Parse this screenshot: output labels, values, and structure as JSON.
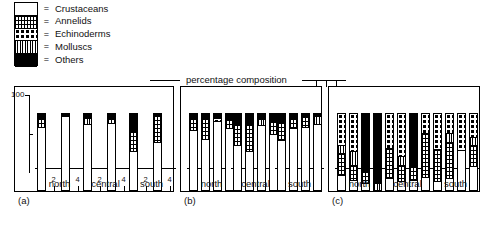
{
  "figure": {
    "header": "percentage  composition",
    "y_axis_label": "100"
  },
  "legend": {
    "items": [
      {
        "label": "Crustaceans",
        "pattern": "p-crust",
        "icon": "white-swatch",
        "equals": "="
      },
      {
        "label": "Annelids",
        "pattern": "p-annel",
        "icon": "fine-grid-swatch",
        "equals": "="
      },
      {
        "label": "Echinoderms",
        "pattern": "p-echin",
        "icon": "dotted-swatch",
        "equals": "="
      },
      {
        "label": "Molluscs",
        "pattern": "p-moll",
        "icon": "vertical-hatch-swatch",
        "equals": "="
      },
      {
        "label": "Others",
        "pattern": "p-other",
        "icon": "black-swatch",
        "equals": "="
      }
    ]
  },
  "panels": [
    {
      "id": "a",
      "label": "(a)"
    },
    {
      "id": "b",
      "label": "(b)"
    },
    {
      "id": "c",
      "label": "(c)"
    }
  ],
  "groups": [
    "north",
    "central",
    "south"
  ],
  "stations": [
    "1",
    "2",
    "3",
    "4"
  ],
  "chart_data": {
    "type": "bar",
    "subtype": "stacked-bar-percentage",
    "title": "percentage  composition",
    "xlabel": "",
    "ylabel": "100",
    "ylim": [
      0,
      100
    ],
    "grid": false,
    "legend_position": "top-left",
    "categories": [
      "Crustaceans",
      "Annelids",
      "Echinoderms",
      "Molluscs",
      "Others"
    ],
    "panels": [
      {
        "panel": "(a)",
        "groups": [
          {
            "name": "north",
            "bars": [
              {
                "station": "1",
                "total": 100,
                "segments": [
                  {
                    "category": "Crustaceans",
                    "value": 82
                  },
                  {
                    "category": "Annelids",
                    "value": 12
                  },
                  {
                    "category": "Others",
                    "value": 6
                  }
                ]
              },
              {
                "station": "2",
                "total": 0,
                "segments": []
              },
              {
                "station": "3",
                "total": 100,
                "segments": [
                  {
                    "category": "Crustaceans",
                    "value": 96
                  },
                  {
                    "category": "Others",
                    "value": 4
                  }
                ]
              },
              {
                "station": "4",
                "total": 0,
                "segments": []
              }
            ]
          },
          {
            "name": "central",
            "bars": [
              {
                "station": "1",
                "total": 100,
                "segments": [
                  {
                    "category": "Crustaceans",
                    "value": 86
                  },
                  {
                    "category": "Molluscs",
                    "value": 7
                  },
                  {
                    "category": "Others",
                    "value": 7
                  }
                ]
              },
              {
                "station": "2",
                "total": 0,
                "segments": []
              },
              {
                "station": "3",
                "total": 100,
                "segments": [
                  {
                    "category": "Crustaceans",
                    "value": 87
                  },
                  {
                    "category": "Annelids",
                    "value": 6
                  },
                  {
                    "category": "Others",
                    "value": 7
                  }
                ]
              },
              {
                "station": "4",
                "total": 0,
                "segments": []
              }
            ]
          },
          {
            "name": "south",
            "bars": [
              {
                "station": "1",
                "total": 100,
                "segments": [
                  {
                    "category": "Crustaceans",
                    "value": 50
                  },
                  {
                    "category": "Annelids",
                    "value": 26
                  },
                  {
                    "category": "Others",
                    "value": 24
                  }
                ]
              },
              {
                "station": "2",
                "total": 0,
                "segments": []
              },
              {
                "station": "3",
                "total": 100,
                "segments": [
                  {
                    "category": "Crustaceans",
                    "value": 62
                  },
                  {
                    "category": "Annelids",
                    "value": 36
                  },
                  {
                    "category": "Others",
                    "value": 2
                  }
                ]
              },
              {
                "station": "4",
                "total": 0,
                "segments": []
              }
            ]
          }
        ]
      },
      {
        "panel": "(b)",
        "groups": [
          {
            "name": "north",
            "bars": [
              {
                "station": "1",
                "total": 100,
                "segments": [
                  {
                    "category": "Crustaceans",
                    "value": 78
                  },
                  {
                    "category": "Annelids",
                    "value": 16
                  },
                  {
                    "category": "Others",
                    "value": 6
                  }
                ]
              },
              {
                "station": "2",
                "total": 100,
                "segments": [
                  {
                    "category": "Crustaceans",
                    "value": 66
                  },
                  {
                    "category": "Annelids",
                    "value": 27
                  },
                  {
                    "category": "Others",
                    "value": 7
                  }
                ]
              },
              {
                "station": "3",
                "total": 100,
                "segments": [
                  {
                    "category": "Crustaceans",
                    "value": 90
                  },
                  {
                    "category": "Echinoderms",
                    "value": 4
                  },
                  {
                    "category": "Others",
                    "value": 6
                  }
                ]
              },
              {
                "station": "4",
                "total": 100,
                "segments": [
                  {
                    "category": "Crustaceans",
                    "value": 80
                  },
                  {
                    "category": "Annelids",
                    "value": 12
                  },
                  {
                    "category": "Others",
                    "value": 8
                  }
                ]
              }
            ]
          },
          {
            "name": "central",
            "bars": [
              {
                "station": "1",
                "total": 100,
                "segments": [
                  {
                    "category": "Crustaceans",
                    "value": 58
                  },
                  {
                    "category": "Annelids",
                    "value": 28
                  },
                  {
                    "category": "Others",
                    "value": 14
                  }
                ]
              },
              {
                "station": "2",
                "total": 100,
                "segments": [
                  {
                    "category": "Crustaceans",
                    "value": 50
                  },
                  {
                    "category": "Annelids",
                    "value": 36
                  },
                  {
                    "category": "Others",
                    "value": 14
                  }
                ]
              },
              {
                "station": "3",
                "total": 100,
                "segments": [
                  {
                    "category": "Crustaceans",
                    "value": 84
                  },
                  {
                    "category": "Molluscs",
                    "value": 8
                  },
                  {
                    "category": "Others",
                    "value": 8
                  }
                ]
              },
              {
                "station": "4",
                "total": 100,
                "segments": [
                  {
                    "category": "Crustaceans",
                    "value": 72
                  },
                  {
                    "category": "Annelids",
                    "value": 18
                  },
                  {
                    "category": "Others",
                    "value": 10
                  }
                ]
              }
            ]
          },
          {
            "name": "south",
            "bars": [
              {
                "station": "1",
                "total": 100,
                "segments": [
                  {
                    "category": "Crustaceans",
                    "value": 64
                  },
                  {
                    "category": "Annelids",
                    "value": 24
                  },
                  {
                    "category": "Others",
                    "value": 12
                  }
                ]
              },
              {
                "station": "2",
                "total": 100,
                "segments": [
                  {
                    "category": "Crustaceans",
                    "value": 80
                  },
                  {
                    "category": "Annelids",
                    "value": 14
                  },
                  {
                    "category": "Others",
                    "value": 6
                  }
                ]
              },
              {
                "station": "3",
                "total": 100,
                "segments": [
                  {
                    "category": "Crustaceans",
                    "value": 82
                  },
                  {
                    "category": "Annelids",
                    "value": 14
                  },
                  {
                    "category": "Others",
                    "value": 4
                  }
                ]
              },
              {
                "station": "4",
                "total": 100,
                "segments": [
                  {
                    "category": "Crustaceans",
                    "value": 86
                  },
                  {
                    "category": "Molluscs",
                    "value": 10
                  },
                  {
                    "category": "Others",
                    "value": 4
                  }
                ]
              }
            ]
          }
        ]
      },
      {
        "panel": "(c)",
        "groups": [
          {
            "name": "north",
            "bars": [
              {
                "station": "1",
                "total": 100,
                "segments": [
                  {
                    "category": "Crustaceans",
                    "value": 18
                  },
                  {
                    "category": "Annelids",
                    "value": 30
                  },
                  {
                    "category": "Molluscs",
                    "value": 10
                  },
                  {
                    "category": "Echinoderms",
                    "value": 42
                  }
                ]
              },
              {
                "station": "2",
                "total": 100,
                "segments": [
                  {
                    "category": "Crustaceans",
                    "value": 12
                  },
                  {
                    "category": "Annelids",
                    "value": 20
                  },
                  {
                    "category": "Molluscs",
                    "value": 18
                  },
                  {
                    "category": "Echinoderms",
                    "value": 50
                  }
                ]
              },
              {
                "station": "3",
                "total": 100,
                "segments": [
                  {
                    "category": "Crustaceans",
                    "value": 8
                  },
                  {
                    "category": "Annelids",
                    "value": 16
                  },
                  {
                    "category": "Others",
                    "value": 76
                  }
                ]
              },
              {
                "station": "4",
                "total": 100,
                "segments": [
                  {
                    "category": "Molluscs",
                    "value": 8
                  },
                  {
                    "category": "Others",
                    "value": 92
                  }
                ]
              }
            ]
          },
          {
            "name": "central",
            "bars": [
              {
                "station": "1",
                "total": 100,
                "segments": [
                  {
                    "category": "Crustaceans",
                    "value": 14
                  },
                  {
                    "category": "Annelids",
                    "value": 40
                  },
                  {
                    "category": "Echinoderms",
                    "value": 46
                  }
                ]
              },
              {
                "station": "2",
                "total": 100,
                "segments": [
                  {
                    "category": "Crustaceans",
                    "value": 10
                  },
                  {
                    "category": "Annelids",
                    "value": 22
                  },
                  {
                    "category": "Molluscs",
                    "value": 12
                  },
                  {
                    "category": "Echinoderms",
                    "value": 56
                  }
                ]
              },
              {
                "station": "3",
                "total": 100,
                "segments": [
                  {
                    "category": "Crustaceans",
                    "value": 12
                  },
                  {
                    "category": "Annelids",
                    "value": 18
                  },
                  {
                    "category": "Others",
                    "value": 70
                  }
                ]
              },
              {
                "station": "4",
                "total": 100,
                "segments": [
                  {
                    "category": "Crustaceans",
                    "value": 16
                  },
                  {
                    "category": "Annelids",
                    "value": 58
                  },
                  {
                    "category": "Echinoderms",
                    "value": 26
                  }
                ]
              }
            ]
          },
          {
            "name": "south",
            "bars": [
              {
                "station": "1",
                "total": 100,
                "segments": [
                  {
                    "category": "Crustaceans",
                    "value": 10
                  },
                  {
                    "category": "Annelids",
                    "value": 42
                  },
                  {
                    "category": "Echinoderms",
                    "value": 48
                  }
                ]
              },
              {
                "station": "2",
                "total": 100,
                "segments": [
                  {
                    "category": "Crustaceans",
                    "value": 14
                  },
                  {
                    "category": "Annelids",
                    "value": 48
                  },
                  {
                    "category": "Molluscs",
                    "value": 12
                  },
                  {
                    "category": "Echinoderms",
                    "value": 26
                  }
                ]
              },
              {
                "station": "3",
                "total": 100,
                "segments": [
                  {
                    "category": "Crustaceans",
                    "value": 52
                  },
                  {
                    "category": "Echinoderms",
                    "value": 48
                  }
                ]
              },
              {
                "station": "4",
                "total": 100,
                "segments": [
                  {
                    "category": "Crustaceans",
                    "value": 30
                  },
                  {
                    "category": "Annelids",
                    "value": 28
                  },
                  {
                    "category": "Molluscs",
                    "value": 10
                  },
                  {
                    "category": "Echinoderms",
                    "value": 32
                  }
                ]
              }
            ]
          }
        ]
      }
    ]
  }
}
